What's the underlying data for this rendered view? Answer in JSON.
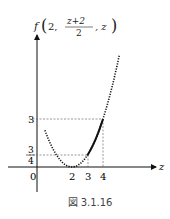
{
  "figure": {
    "caption": "図 3.1.16",
    "y_axis_label": {
      "func": "f",
      "arg1": "2,",
      "frac_num": "z+2",
      "frac_den": "2",
      "arg3": ", z"
    },
    "x_axis_label": "z",
    "origin_label": "0",
    "x_ticks": [
      "2",
      "3",
      "4"
    ],
    "y_ticks": {
      "three": "3",
      "frac_num": "3",
      "frac_den": "4"
    }
  },
  "chart_data": {
    "type": "line",
    "xlabel": "z",
    "ylabel": "f(2, (z+2)/2, z)",
    "function": "(3/4)(z-2)^2",
    "series": [
      {
        "name": "dotted curve",
        "style": "dotted",
        "x": [
          0.3,
          1,
          2,
          3,
          4,
          4.9
        ],
        "y": [
          2.17,
          0.75,
          0,
          0.75,
          3,
          6.31
        ]
      },
      {
        "name": "solid segment",
        "style": "solid",
        "x": [
          3,
          3.5,
          4
        ],
        "y": [
          0.75,
          1.69,
          3
        ]
      }
    ],
    "guide_lines": [
      {
        "from": [
          0,
          3
        ],
        "to": [
          4,
          3
        ],
        "style": "dashed"
      },
      {
        "from": [
          0,
          0.75
        ],
        "to": [
          3,
          0.75
        ],
        "style": "dashed"
      },
      {
        "from": [
          3,
          0
        ],
        "to": [
          3,
          0.75
        ],
        "style": "dashed"
      },
      {
        "from": [
          4,
          0
        ],
        "to": [
          4,
          3
        ],
        "style": "dashed"
      }
    ],
    "x_ticks": [
      0,
      2,
      3,
      4
    ],
    "y_ticks": [
      0.75,
      3
    ]
  }
}
